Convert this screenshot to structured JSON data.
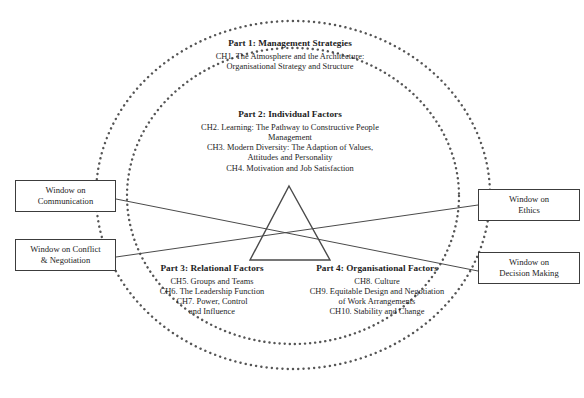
{
  "diagram": {
    "title_text_present": false,
    "colors": {
      "line": "#4a4a4a",
      "dotted_ring": "#555555",
      "box_border": "#3c3c3c",
      "text": "#1d1d1d",
      "background": "#ffffff"
    },
    "parts": [
      {
        "id": "part1",
        "title": "Part 1: Management Strategies",
        "lines": [
          "CH1. The Atmosphere and the Architecture:",
          "Organisational Strategy and Structure"
        ]
      },
      {
        "id": "part2",
        "title": "Part 2: Individual Factors",
        "lines": [
          "CH2. Learning: The Pathway to Constructive People",
          "Management",
          "CH3. Modern Diversity: The Adaption of Values,",
          "Attitudes and Personality",
          "CH4. Motivation and Job Satisfaction"
        ]
      },
      {
        "id": "part3",
        "title": "Part 3: Relational Factors",
        "lines": [
          "CH5. Groups and Teams",
          "CH6. The Leadership Function",
          "CH7. Power, Control",
          "and Influence"
        ]
      },
      {
        "id": "part4",
        "title": "Part 4: Organisational Factors",
        "lines": [
          "CH8. Culture",
          "CH9. Equitable Design and Negotiation",
          "of Work Arrangements",
          "CH10. Stability and Change"
        ]
      }
    ],
    "windows": [
      {
        "id": "communication",
        "lines": [
          "Window on",
          "Communication"
        ]
      },
      {
        "id": "conflict",
        "lines": [
          "Window on Conflict",
          "& Negotiation"
        ]
      },
      {
        "id": "ethics",
        "lines": [
          "Window on",
          "Ethics"
        ]
      },
      {
        "id": "decision",
        "lines": [
          "Window on",
          "Decision Making"
        ]
      }
    ],
    "shapes": {
      "outer_ring": {
        "cx": 293,
        "cy": 195,
        "rx": 197,
        "ry": 174,
        "style": "dotted"
      },
      "inner_ring": {
        "cx": 293,
        "cy": 196,
        "rx": 166,
        "ry": 148,
        "style": "dotted"
      },
      "triangle": {
        "apex_x": 289,
        "apex_y": 186,
        "base_left_x": 250,
        "base_right_x": 330,
        "base_y": 260
      }
    },
    "connectors": [
      {
        "from": "communication",
        "to": "decision"
      },
      {
        "from": "conflict",
        "to": "ethics"
      }
    ]
  }
}
